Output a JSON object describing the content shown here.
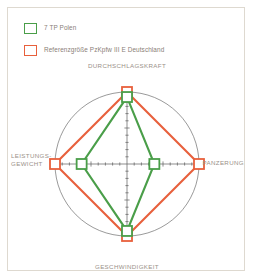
{
  "legend": {
    "items": [
      {
        "label": "7 TP Polen",
        "color": "#4a9e49",
        "swatch_icon": "legend-square-green"
      },
      {
        "label": "Referenzgröße PzKpfw III E Deutschland",
        "color": "#e8603c",
        "swatch_icon": "legend-square-red"
      }
    ]
  },
  "axis_labels": {
    "top": "DURCHSCHLAGSKRAFT",
    "right": "PANZERUNG",
    "bottom": "GESCHWINDIGKEIT",
    "left_line1": "LEISTUNGS-",
    "left_line2": "GEWICHT"
  },
  "colors": {
    "green": "#4a9e49",
    "red": "#e8603c",
    "axis": "#5c5c5c",
    "circle": "#6e6e6e",
    "text": "#9a9189",
    "border": "#ded9d0"
  },
  "chart_data": {
    "type": "radar",
    "title": "",
    "categories": [
      "DURCHSCHLAGSKRAFT",
      "PANZERUNG",
      "GESCHWINDIGKEIT",
      "LEISTUNGS-GEWICHT"
    ],
    "series": [
      {
        "name": "Referenzgröße PzKpfw III E Deutschland",
        "color": "#e8603c",
        "values": [
          100,
          100,
          100,
          100
        ]
      },
      {
        "name": "7 TP Polen",
        "color": "#4a9e49",
        "values": [
          93,
          38,
          93,
          63
        ]
      }
    ],
    "rlim": [
      0,
      100
    ],
    "grid": "ticks-on-axes",
    "ticks_per_axis": 10,
    "outer_shape": "circle",
    "markers": "square",
    "legend_position": "top-left"
  }
}
